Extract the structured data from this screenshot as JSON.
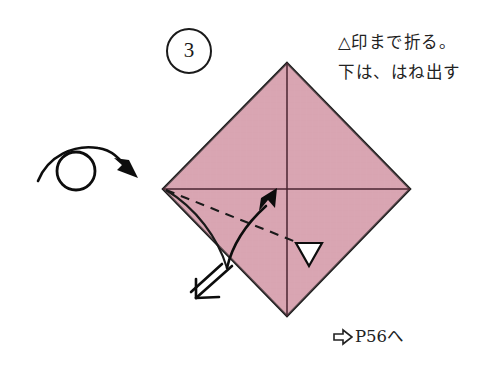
{
  "page": {
    "background_color": "#ffffff",
    "width": 491,
    "height": 367
  },
  "step": {
    "number": "3",
    "badge_shape": "circle"
  },
  "instructions": {
    "lines": [
      "△印まで折る。",
      "下は、はね出す"
    ]
  },
  "footer": {
    "arrow_icon": "block-arrow-right-icon",
    "text": "P56へ"
  },
  "diagram": {
    "paper_color": "#d9a5b2",
    "paper_edge_color": "#1a1a1a",
    "crease_color": "#4a2430",
    "symbols": [
      {
        "name": "turn-over-icon",
        "description": "loop arrow indicating turn the model over"
      },
      {
        "name": "valley-fold-dashed-line",
        "description": "dashed fold line from left vertex"
      },
      {
        "name": "fold-direction-arrow",
        "description": "curved arrow pointing up-right"
      },
      {
        "name": "triangle-mark-icon",
        "description": "small white triangle reference mark"
      },
      {
        "name": "push-in-arrow-icon",
        "description": "double-line arrow pointing down-left"
      }
    ],
    "shape": {
      "type": "diamond",
      "top": [
        287,
        63
      ],
      "right": [
        410,
        189
      ],
      "bottom": [
        287,
        316
      ],
      "left": [
        163,
        189
      ]
    }
  }
}
